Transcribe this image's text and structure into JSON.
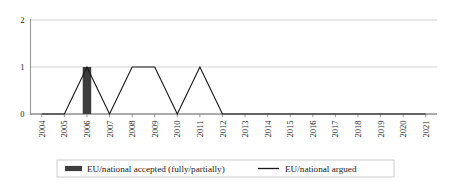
{
  "chart_data": {
    "type": "line",
    "title": "",
    "subtitle": "",
    "xlabel": "",
    "ylabel": "",
    "grid": true,
    "legend_position": "bottom",
    "ylim": [
      0,
      2
    ],
    "yticks": [
      "0",
      "1",
      "2"
    ],
    "categories": [
      "2004",
      "2005",
      "2006",
      "2007",
      "2008",
      "2009",
      "2010",
      "2011",
      "2012",
      "2013",
      "2014",
      "2015",
      "2016",
      "2017",
      "2018",
      "2019",
      "2020",
      "2021"
    ],
    "series": [
      {
        "name": "EU/national accepted (fully/partially)",
        "type": "bar",
        "color": "#3d3d3d",
        "values": [
          0,
          0,
          1,
          0,
          0,
          0,
          0,
          0,
          0,
          0,
          0,
          0,
          0,
          0,
          0,
          0,
          0,
          0
        ]
      },
      {
        "name": "EU/national argued",
        "type": "line",
        "color": "#1a1a1a",
        "values": [
          0,
          0,
          1,
          0,
          1,
          1,
          0,
          1,
          0,
          0,
          0,
          0,
          0,
          0,
          0,
          0,
          0,
          0
        ]
      }
    ],
    "annotations": []
  },
  "legend": {
    "items": [
      {
        "label": "EU/national accepted (fully/partially)",
        "marker": "bar-swatch-icon",
        "color": "#3d3d3d"
      },
      {
        "label": "EU/national argued",
        "marker": "line-swatch-icon",
        "color": "#1a1a1a"
      }
    ]
  },
  "colors": {
    "bar": "#3d3d3d",
    "line": "#1a1a1a",
    "grid": "#cfcfcf",
    "axis": "#9a9a9a",
    "legend_border": "#c8c8c8",
    "background": "#ffffff"
  }
}
